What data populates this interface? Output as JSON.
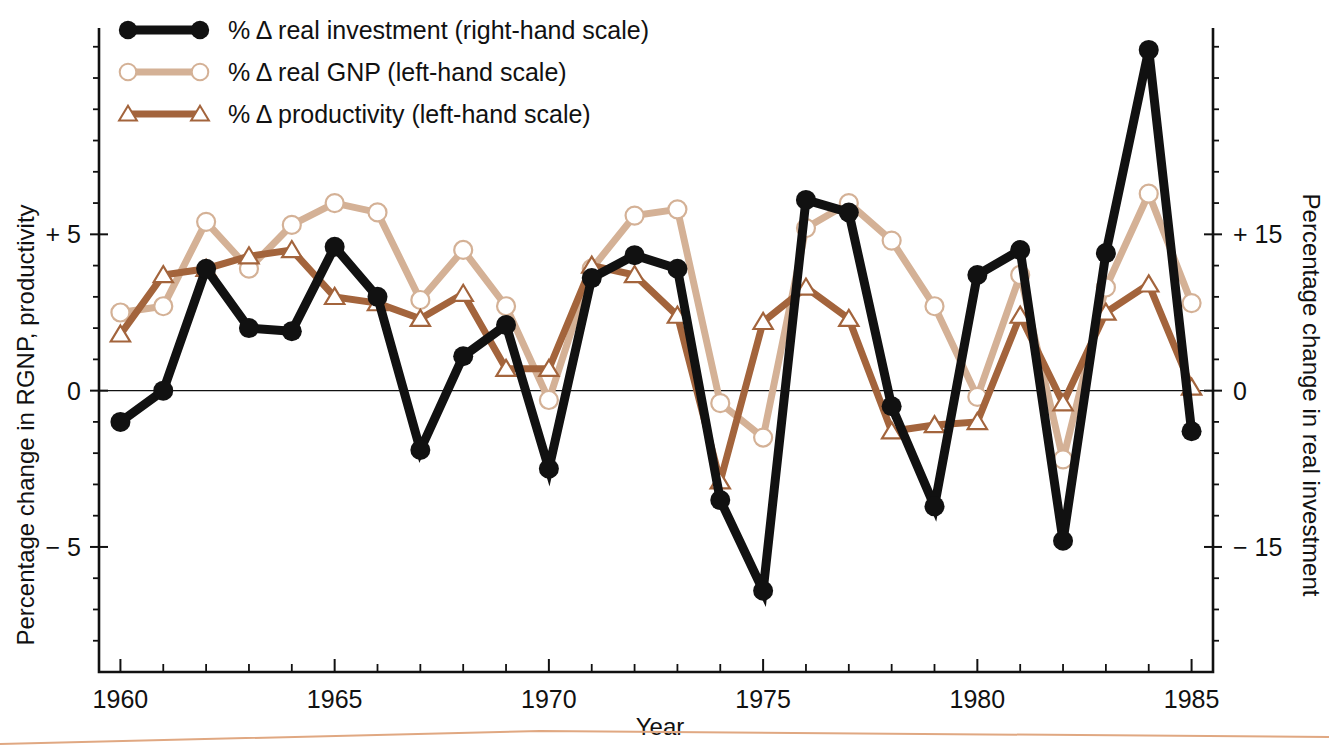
{
  "chart_data": {
    "type": "line",
    "title": "",
    "xlabel": "Year",
    "ylabel_left": "Percentage change in RGNP, productivity",
    "ylabel_right": "Percentage change in real investment",
    "x": [
      1960,
      1961,
      1962,
      1963,
      1964,
      1965,
      1966,
      1967,
      1968,
      1969,
      1970,
      1971,
      1972,
      1973,
      1974,
      1975,
      1976,
      1977,
      1978,
      1979,
      1980,
      1981,
      1982,
      1983,
      1984,
      1985
    ],
    "xlim": [
      1959.5,
      1985.5
    ],
    "xticks_major": [
      1960,
      1965,
      1970,
      1975,
      1980,
      1985
    ],
    "xticklabels": [
      "1960",
      "1965",
      "1970",
      "1975",
      "1980",
      "1985"
    ],
    "ylim_left": [
      -9.0,
      11.6
    ],
    "yticks_left": [
      -5,
      0,
      5
    ],
    "yticklabels_left": [
      "− 5",
      "0",
      "+ 5"
    ],
    "ylim_right": [
      -27.0,
      34.8
    ],
    "yticks_right": [
      -15,
      0,
      15
    ],
    "yticklabels_right": [
      "− 15",
      "0",
      "+ 15"
    ],
    "right_scale_factor": 3,
    "grid": false,
    "legend_position": "top-left",
    "series": [
      {
        "name": "% Δ real investment (right-hand scale)",
        "axis": "right",
        "color": "#111111",
        "marker": "filled-circle",
        "linewidth": 9,
        "values": [
          -3.0,
          0.0,
          11.7,
          6.0,
          5.7,
          13.8,
          9.0,
          -5.7,
          3.3,
          6.3,
          -7.5,
          10.8,
          13.0,
          11.7,
          -10.5,
          -19.2,
          18.3,
          17.1,
          -1.5,
          -11.1,
          11.1,
          13.5,
          -14.4,
          13.2,
          32.7,
          -3.9
        ]
      },
      {
        "name": "% Δ real GNP (left-hand scale)",
        "axis": "left",
        "color": "#d4b196",
        "marker": "open-circle",
        "linewidth": 7,
        "values": [
          2.5,
          2.7,
          5.4,
          3.9,
          5.3,
          6.0,
          5.7,
          2.9,
          4.5,
          2.7,
          -0.3,
          3.9,
          5.6,
          5.8,
          -0.4,
          -1.5,
          5.2,
          6.0,
          4.8,
          2.7,
          -0.2,
          3.7,
          -2.2,
          3.3,
          6.3,
          2.8
        ]
      },
      {
        "name": "% Δ productivity (left-hand scale)",
        "axis": "left",
        "color": "#a3643c",
        "marker": "open-triangle",
        "linewidth": 7,
        "values": [
          1.8,
          3.7,
          3.9,
          4.3,
          4.5,
          3.0,
          2.8,
          2.3,
          3.1,
          0.7,
          0.7,
          4.0,
          3.7,
          2.4,
          -2.9,
          2.2,
          3.3,
          2.3,
          -1.3,
          -1.1,
          -1.0,
          2.4,
          -0.4,
          2.5,
          3.4,
          0.1
        ]
      }
    ]
  },
  "axes": {
    "left_title": "Percentage change in RGNP, productivity",
    "right_title": "Percentage change in real investment",
    "x_title": "Year"
  },
  "legend": {
    "items": [
      {
        "label": "% Δ real investment (right-hand scale)",
        "marker": "filled-circle",
        "color": "#111111"
      },
      {
        "label": "% Δ real GNP (left-hand scale)",
        "marker": "open-circle",
        "color": "#d4b196"
      },
      {
        "label": "% Δ productivity (left-hand scale)",
        "marker": "open-triangle",
        "color": "#a3643c"
      }
    ]
  }
}
